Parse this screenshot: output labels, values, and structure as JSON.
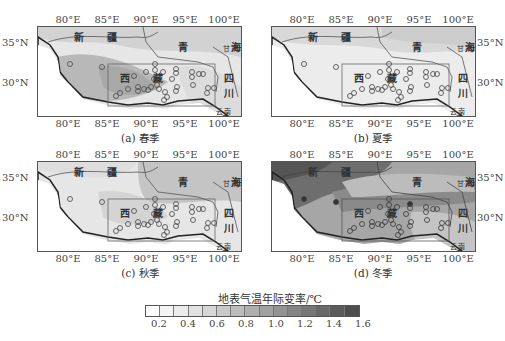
{
  "figure": {
    "x_ticks": [
      "80°E",
      "85°E",
      "90°E",
      "95°E",
      "100°E"
    ],
    "y_ticks": [
      "35°N",
      "30°N"
    ],
    "province_labels": {
      "xinjiang": "新 疆",
      "qinghai": "青 海",
      "xizang": "西 藏",
      "sichuan_1": "四",
      "sichuan_2": "川",
      "gansu": "甘肃",
      "yunnan": "云南"
    },
    "panels": [
      {
        "id": "a",
        "caption": "(a) 春季",
        "season": "spring"
      },
      {
        "id": "b",
        "caption": "(b) 夏季",
        "season": "summer"
      },
      {
        "id": "c",
        "caption": "(c) 秋季",
        "season": "autumn"
      },
      {
        "id": "d",
        "caption": "(d) 冬季",
        "season": "winter"
      }
    ],
    "colorbar": {
      "title": "地表气温年际变率/℃",
      "ticks": [
        "0.2",
        "0.4",
        "0.6",
        "0.8",
        "1.0",
        "1.2",
        "1.4",
        "1.6"
      ],
      "colors": [
        "#ffffff",
        "#f4f4f4",
        "#ececec",
        "#e2e2e2",
        "#d6d6d6",
        "#c9c9c9",
        "#bcbcbc",
        "#afafaf",
        "#a1a1a1",
        "#939393",
        "#858585",
        "#777777",
        "#696969",
        "#5b5b5b",
        "#4d4d4d"
      ]
    }
  },
  "chart_data": {
    "type": "heatmap",
    "colorbar_label": "地表气温年际变率/℃",
    "colorbar_range": [
      0.1,
      1.7
    ],
    "colorbar_ticks": [
      0.2,
      0.4,
      0.6,
      0.8,
      1.0,
      1.2,
      1.4,
      1.6
    ],
    "x_axis": {
      "label": "Longitude",
      "ticks": [
        "80°E",
        "85°E",
        "90°E",
        "95°E",
        "100°E"
      ],
      "range": [
        76,
        102
      ]
    },
    "y_axis": {
      "label": "Latitude",
      "ticks": [
        "30°N",
        "35°N"
      ],
      "range": [
        26,
        37
      ]
    },
    "panels": [
      {
        "caption": "(a) 春季",
        "season": "Spring",
        "approx_range": [
          0.4,
          1.0
        ],
        "note": "highest (~0.8–1.0) in central/western Xizang, lower (~0.4–0.6) to the east"
      },
      {
        "caption": "(b) 夏季",
        "season": "Summer",
        "approx_range": [
          0.2,
          0.6
        ],
        "note": "lowest variability; mostly ~0.3–0.5"
      },
      {
        "caption": "(c) 秋季",
        "season": "Autumn",
        "approx_range": [
          0.4,
          0.9
        ],
        "note": "moderate, higher in central plateau"
      },
      {
        "caption": "(d) 冬季",
        "season": "Winter",
        "approx_range": [
          0.6,
          1.6
        ],
        "note": "highest variability; ~1.4–1.6 in west/northwest, ~0.8–1.0 in southeast"
      }
    ],
    "annotations": [
      "新疆",
      "青海",
      "西藏",
      "四川",
      "甘肃",
      "云南"
    ],
    "inner_box": {
      "lon": [
        85,
        99
      ],
      "lat": [
        27,
        32.5
      ]
    }
  }
}
